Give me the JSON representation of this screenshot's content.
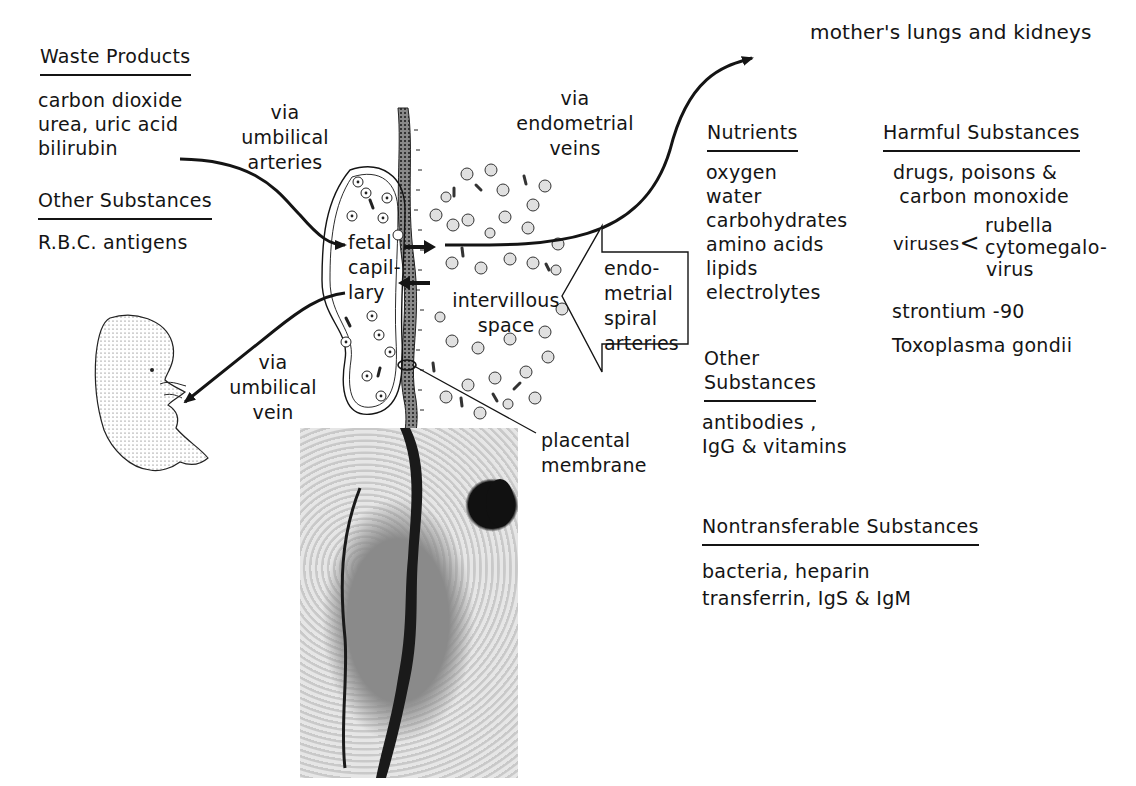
{
  "diagram": {
    "title_arrow_target": "mother's lungs and kidneys",
    "labels": {
      "via_umbilical_arteries": [
        "via",
        "umbilical",
        "arteries"
      ],
      "via_endometrial_veins": [
        "via",
        "endometrial",
        "veins"
      ],
      "via_umbilical_vein": [
        "via",
        "umbilical",
        "vein"
      ],
      "fetal_capillary": [
        "fetal",
        "capil-",
        "lary"
      ],
      "intervillous_space": [
        "intervillous",
        "space"
      ],
      "endometrial_spiral_arteries": [
        "endo-",
        "metrial",
        "spiral",
        "arteries"
      ],
      "placental_membrane": [
        "placental",
        "membrane"
      ]
    },
    "waste_products": {
      "heading": "Waste Products",
      "items": [
        "carbon dioxide",
        "urea, uric acid",
        "bilirubin"
      ]
    },
    "other_substances_fetal": {
      "heading": "Other  Substances",
      "items": [
        "R.B.C. antigens"
      ]
    },
    "nutrients": {
      "heading": "Nutrients",
      "items": [
        "oxygen",
        "water",
        "carbohydrates",
        "amino acids",
        "lipids",
        "electrolytes"
      ]
    },
    "other_substances_maternal": {
      "heading_lines": [
        "Other",
        "Substances"
      ],
      "items": [
        "antibodies ,",
        "IgG & vitamins"
      ]
    },
    "harmful_substances": {
      "heading": "Harmful Substances",
      "items": [
        "drugs, poisons &",
        " carbon monoxide"
      ],
      "viruses_label": "viruses",
      "viruses": [
        "rubella",
        "cytomegalo-",
        "virus"
      ],
      "more_items": [
        "strontium -90",
        "Toxoplasma gondii"
      ]
    },
    "nontransferable_substances": {
      "heading": "Nontransferable Substances",
      "items": [
        "bacteria, heparin",
        "transferrin, IgS & IgM"
      ]
    },
    "images": {
      "fetus": "fetus-illustration",
      "micrograph": "placental-membrane-micrograph"
    }
  }
}
